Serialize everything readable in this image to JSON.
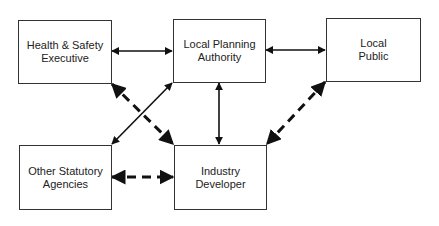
{
  "diagram": {
    "nodes": [
      {
        "id": "hse",
        "lines": [
          "Health & Safety",
          "Executive"
        ]
      },
      {
        "id": "lpa",
        "lines": [
          "Local Planning",
          "Authority"
        ]
      },
      {
        "id": "public",
        "lines": [
          "Local",
          "Public"
        ]
      },
      {
        "id": "osa",
        "lines": [
          "Other Statutory",
          "Agencies"
        ]
      },
      {
        "id": "dev",
        "lines": [
          "Industry",
          "Developer"
        ]
      }
    ],
    "edges": [
      {
        "from": "hse",
        "to": "lpa",
        "style": "solid",
        "direction": "both"
      },
      {
        "from": "lpa",
        "to": "public",
        "style": "solid",
        "direction": "both"
      },
      {
        "from": "lpa",
        "to": "dev",
        "style": "solid",
        "direction": "both"
      },
      {
        "from": "lpa",
        "to": "osa",
        "style": "solid",
        "direction": "both"
      },
      {
        "from": "hse",
        "to": "dev",
        "style": "dashed",
        "direction": "both"
      },
      {
        "from": "public",
        "to": "dev",
        "style": "dashed",
        "direction": "both"
      },
      {
        "from": "osa",
        "to": "dev",
        "style": "dashed",
        "direction": "both"
      }
    ]
  }
}
